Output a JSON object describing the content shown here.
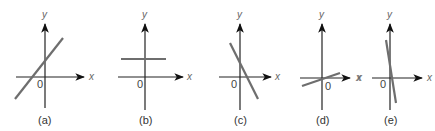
{
  "figure": {
    "panels": [
      {
        "caption": "(a)",
        "x_label": "x",
        "y_label": "y",
        "origin_label": "0",
        "description": "line with positive slope, positive y-intercept"
      },
      {
        "caption": "(b)",
        "x_label": "x",
        "y_label": "y",
        "origin_label": "0",
        "description": "horizontal line above x-axis (zero slope)"
      },
      {
        "caption": "(c)",
        "x_label": "x",
        "y_label": "y",
        "origin_label": "0",
        "description": "line with negative slope, positive y-intercept"
      },
      {
        "caption": "(d)",
        "x_label": "x",
        "y_label": "y",
        "origin_label": "0",
        "description": "line with small positive slope through origin"
      },
      {
        "caption": "(e)",
        "x_label": "x",
        "y_label": "y",
        "origin_label": "0",
        "stray_label": "x",
        "description": "nearly vertical line with steep negative slope through origin"
      }
    ]
  }
}
